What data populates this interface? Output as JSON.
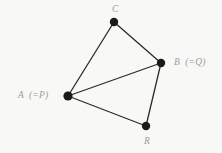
{
  "figure": {
    "kind": "geometry-diagram",
    "background_color": "#f8f8f6",
    "stroke_color": "#2b2b2b",
    "vertex_color": "#1a1a1a",
    "label_color": "#9d9d9d",
    "width": 222,
    "height": 153,
    "vertices": [
      {
        "id": "C",
        "label": "C",
        "x": 114,
        "y": 22,
        "r": 4.2,
        "label_x": 112,
        "label_y": 5,
        "label_align": "center"
      },
      {
        "id": "B",
        "label": "B  (=Q)",
        "x": 161,
        "y": 63,
        "r": 4.2,
        "label_x": 174,
        "label_y": 58,
        "label_align": "left"
      },
      {
        "id": "A",
        "label": "A  (=P)",
        "x": 68,
        "y": 96,
        "r": 4.6,
        "label_x": 18,
        "label_y": 91,
        "label_align": "left"
      },
      {
        "id": "R",
        "label": "R",
        "x": 146,
        "y": 126,
        "r": 4.2,
        "label_x": 144,
        "label_y": 137,
        "label_align": "center"
      }
    ],
    "edges": [
      {
        "id": "A-C",
        "from": "A",
        "to": "C",
        "x1": 68,
        "y1": 96,
        "x2": 114,
        "y2": 22,
        "width": 1.3
      },
      {
        "id": "C-B",
        "from": "C",
        "to": "B",
        "x1": 114,
        "y1": 22,
        "x2": 161,
        "y2": 63,
        "width": 1.3
      },
      {
        "id": "A-B",
        "from": "A",
        "to": "B",
        "x1": 68,
        "y1": 96,
        "x2": 161,
        "y2": 63,
        "width": 1.3
      },
      {
        "id": "A-R",
        "from": "A",
        "to": "R",
        "x1": 68,
        "y1": 96,
        "x2": 146,
        "y2": 126,
        "width": 1.3
      },
      {
        "id": "R-B",
        "from": "R",
        "to": "B",
        "x1": 146,
        "y1": 126,
        "x2": 161,
        "y2": 63,
        "width": 1.3
      }
    ]
  }
}
